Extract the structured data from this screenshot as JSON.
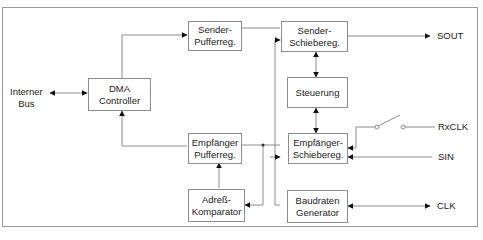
{
  "diagram": {
    "blocks": {
      "dma": [
        "DMA",
        "Controller"
      ],
      "sender_puffer": [
        "Sender-",
        "Pufferreg."
      ],
      "sender_schiebe": [
        "Sender-",
        "Schiebereg."
      ],
      "steuerung": [
        "Steuerung"
      ],
      "empf_puffer": [
        "Empfänger",
        "Pufferreg."
      ],
      "empf_schiebe": [
        "Empfänger-",
        "Schiebereg."
      ],
      "adress": [
        "Adreß-",
        "Komparator"
      ],
      "baud": [
        "Baudraten",
        "Generator"
      ]
    },
    "signals": {
      "internal_bus": [
        "Interner",
        "Bus"
      ],
      "sout": "SOUT",
      "rxclk": "RxCLK",
      "sin": "SIN",
      "clk": "CLK"
    },
    "colors": {
      "line": "#8c8c8c",
      "arrow": "#111111",
      "frame": "#9a9a9a"
    }
  }
}
